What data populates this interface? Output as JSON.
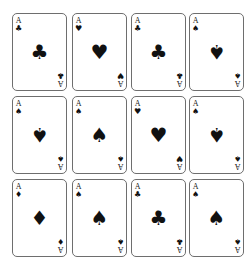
{
  "cards": [
    {
      "rank": "A",
      "suit": "club",
      "glyph": "♣",
      "x": 12,
      "y": 13,
      "inverted": false
    },
    {
      "rank": "A",
      "suit": "heart",
      "glyph": "♥",
      "x": 72,
      "y": 13,
      "inverted": false
    },
    {
      "rank": "A",
      "suit": "club",
      "glyph": "♣",
      "x": 131,
      "y": 13,
      "inverted": false
    },
    {
      "rank": "A",
      "suit": "spade",
      "glyph": "♠",
      "x": 189,
      "y": 13,
      "inverted": true
    },
    {
      "rank": "A",
      "suit": "spade",
      "glyph": "♠",
      "x": 12,
      "y": 96,
      "inverted": true
    },
    {
      "rank": "A",
      "suit": "spade",
      "glyph": "♠",
      "x": 72,
      "y": 96,
      "inverted": false
    },
    {
      "rank": "A",
      "suit": "heart",
      "glyph": "♥",
      "x": 131,
      "y": 96,
      "inverted": false
    },
    {
      "rank": "A",
      "suit": "spade",
      "glyph": "♠",
      "x": 189,
      "y": 96,
      "inverted": true
    },
    {
      "rank": "A",
      "suit": "diamond",
      "glyph": "♦",
      "x": 12,
      "y": 179,
      "inverted": false
    },
    {
      "rank": "A",
      "suit": "spade",
      "glyph": "♠",
      "x": 72,
      "y": 179,
      "inverted": false
    },
    {
      "rank": "A",
      "suit": "club",
      "glyph": "♣",
      "x": 131,
      "y": 179,
      "inverted": false
    },
    {
      "rank": "A",
      "suit": "spade",
      "glyph": "♠",
      "x": 189,
      "y": 179,
      "inverted": false
    }
  ]
}
